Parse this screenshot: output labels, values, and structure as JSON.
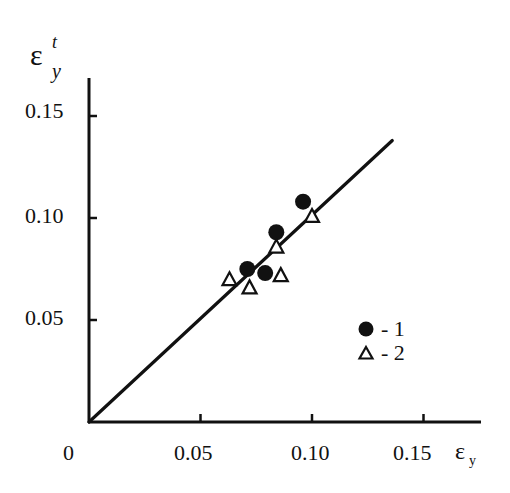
{
  "chart_data": {
    "type": "scatter",
    "title": "",
    "xlabel": "ε_y",
    "ylabel": "ε_y^t",
    "xlim": [
      0,
      0.16
    ],
    "ylim": [
      0,
      0.16
    ],
    "x_ticks": [
      "0",
      "0.05",
      "0.10",
      "0.15"
    ],
    "y_ticks": [
      "0.05",
      "0.10",
      "0.15"
    ],
    "grid": false,
    "legend_position": "lower right inside",
    "series": [
      {
        "name": "1",
        "marker": "filled-circle",
        "points": [
          [
            0.071,
            0.075
          ],
          [
            0.079,
            0.073
          ],
          [
            0.084,
            0.093
          ],
          [
            0.096,
            0.108
          ]
        ]
      },
      {
        "name": "2",
        "marker": "open-triangle",
        "points": [
          [
            0.063,
            0.07
          ],
          [
            0.072,
            0.066
          ],
          [
            0.086,
            0.072
          ],
          [
            0.084,
            0.086
          ],
          [
            0.1,
            0.101
          ]
        ]
      }
    ],
    "fit_line": {
      "name": "line",
      "from": [
        0,
        0
      ],
      "to": [
        0.136,
        0.138
      ]
    }
  },
  "labels": {
    "origin": "0",
    "x_ticks": [
      "0.05",
      "0.10",
      "0.15"
    ],
    "y_ticks": [
      "0.15",
      "0.10",
      "0.05"
    ],
    "x_axis_symbol": "ε",
    "x_axis_sub": "y",
    "y_axis_symbol": "ε",
    "y_axis_sub": "y",
    "y_axis_sup": "t"
  },
  "legend": [
    {
      "marker": "filled-circle",
      "label": "- 1"
    },
    {
      "marker": "open-triangle",
      "label": "- 2"
    }
  ]
}
